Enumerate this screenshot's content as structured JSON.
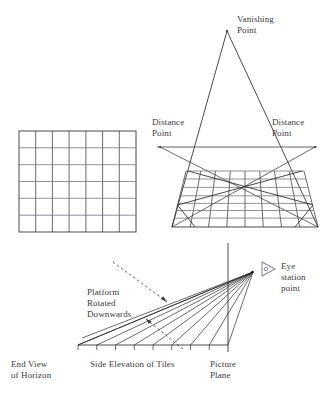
{
  "figure": {
    "title_absent": true,
    "background_color": "#ffffff",
    "ink_color": "#2b2b2b",
    "text_color": "#3b3b3b",
    "accent_gray": "#8c8c99"
  },
  "labels": {
    "vanishing_point": "Vanishing\nPoint",
    "distance_point_left": "Distance\nPoint",
    "distance_point_right": "Distance\nPoint",
    "platform_rotated": "Platform\nRotated\nDownwards",
    "eye_station_point": "Eye\nstation\npoint",
    "end_view_of_horizon": "End View\nof Horizon",
    "side_elevation_of_tiles": "Side Elevation of Tiles",
    "picture_plane": "Picture\nPlane"
  },
  "plan_grid": {
    "name": "plan-view-tile-grid",
    "x": 19,
    "y": 131,
    "width": 117,
    "height": 101,
    "columns": 7,
    "rows": 6
  },
  "perspective_grid": {
    "name": "perspective-tile-grid",
    "top_y": 171,
    "bottom_y": 227,
    "top_left_x": 186,
    "top_right_x": 304,
    "bottom_left_x": 172,
    "bottom_right_x": 318,
    "columns": 8,
    "rows": 7,
    "diagonals": 2
  },
  "vanishing_point": {
    "x": 227,
    "y": 31
  },
  "horizon_line": {
    "x1": 157,
    "y1": 147,
    "x2": 317,
    "y2": 147
  },
  "distance_points": [
    {
      "x": 160,
      "y": 147
    },
    {
      "x": 315,
      "y": 147
    }
  ],
  "side_elevation": {
    "baseline": {
      "x1": 78,
      "y1": 345,
      "x2": 228,
      "y2": 345
    },
    "ticks": 8,
    "eye_point": {
      "x": 253,
      "y": 272
    },
    "rays": 9,
    "picture_plane_line": {
      "x": 228,
      "y1": 243,
      "y2": 352
    }
  },
  "dashed_arrow": {
    "name": "platform-rotation-arrow",
    "from": {
      "x": 113,
      "y": 262
    },
    "to": {
      "x": 165,
      "y": 300
    }
  },
  "eye_marker": {
    "name": "eye-station-arrow-marker",
    "x": 262,
    "y": 268,
    "color": "#8c8c99"
  }
}
